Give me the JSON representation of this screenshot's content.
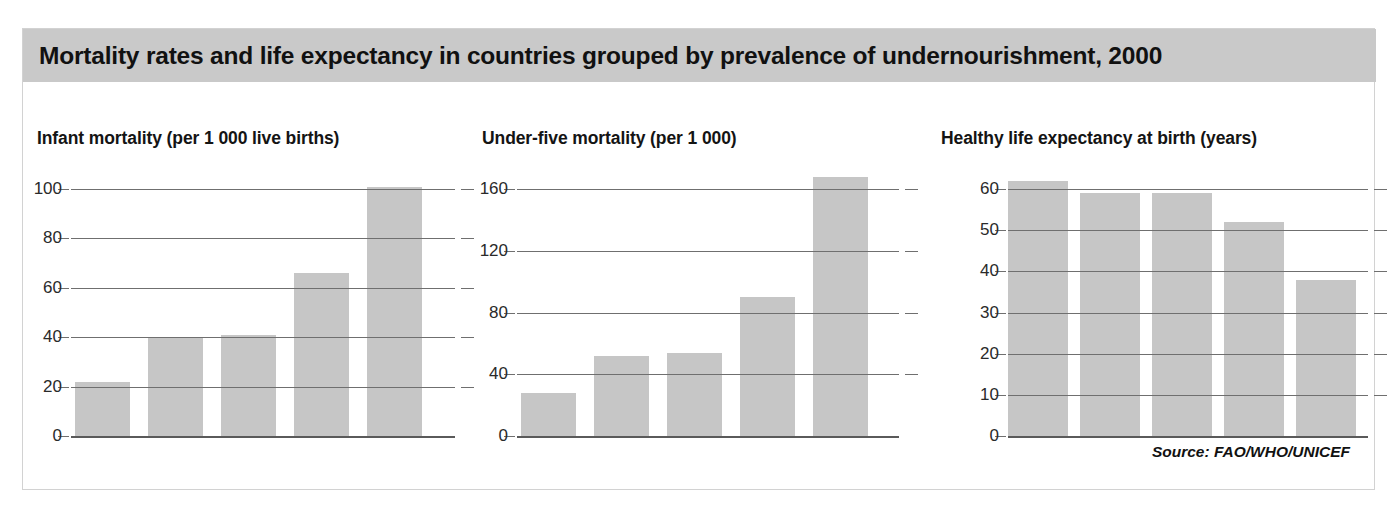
{
  "figure": {
    "title": "Mortality rates and life expectancy in countries grouped by prevalence of undernourishment, 2000",
    "source": "Source: FAO/WHO/UNICEF",
    "x_axis_title": "% of population undernourished",
    "header_color": "#c9c9c9",
    "bar_color": "#c6c6c6",
    "gridline_color": "#6f6f6f",
    "panel_border_color": "#d2d2d2"
  },
  "chart_data": [
    {
      "type": "bar",
      "title": "Infant mortality (per 1 000 live births)",
      "xlabel": "% of population undernourished",
      "ylabel": "",
      "categories": [
        "<2.5",
        "2.5–4",
        "5–19",
        "20–34",
        "≥35"
      ],
      "values": [
        22,
        40,
        41,
        66,
        101
      ],
      "yticks": [
        0,
        20,
        40,
        60,
        80,
        100
      ],
      "ytick_labels": [
        "0",
        "20",
        "40",
        "60",
        "80",
        "100"
      ],
      "ylim": [
        0,
        100
      ],
      "grid": true,
      "legend": "none"
    },
    {
      "type": "bar",
      "title": "Under-five mortality (per 1 000)",
      "xlabel": "% of population undernourished",
      "ylabel": "",
      "categories": [
        "<2.5",
        "2.5–4",
        "5–19",
        "20–34",
        "≥35"
      ],
      "values": [
        28,
        52,
        54,
        90,
        168
      ],
      "yticks": [
        0,
        40,
        80,
        120,
        160
      ],
      "ytick_labels": [
        "0",
        "40",
        "80",
        "120",
        "160"
      ],
      "ylim": [
        0,
        160
      ],
      "grid": true,
      "legend": "none"
    },
    {
      "type": "bar",
      "title": "Healthy life expectancy at birth (years)",
      "xlabel": "% of population undernourished",
      "ylabel": "",
      "categories": [
        "<2.5",
        "2.5–4",
        "5–19",
        "20–34",
        "≥35"
      ],
      "values": [
        62,
        59,
        59,
        52,
        38
      ],
      "yticks": [
        0,
        10,
        20,
        30,
        40,
        50,
        60
      ],
      "ytick_labels": [
        "0",
        "10",
        "20",
        "30",
        "40",
        "50",
        "60"
      ],
      "ylim": [
        0,
        60
      ],
      "grid": true,
      "legend": "none"
    }
  ]
}
